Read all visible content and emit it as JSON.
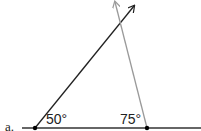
{
  "diagram": {
    "part_label": "a.",
    "angles": [
      {
        "label": "50°",
        "vertex": "left"
      },
      {
        "label": "75°",
        "vertex": "right"
      }
    ],
    "colors": {
      "baseline": "#333333",
      "left_ray": "#222222",
      "right_ray": "#9a9a9a",
      "vertex": "#000000"
    }
  }
}
